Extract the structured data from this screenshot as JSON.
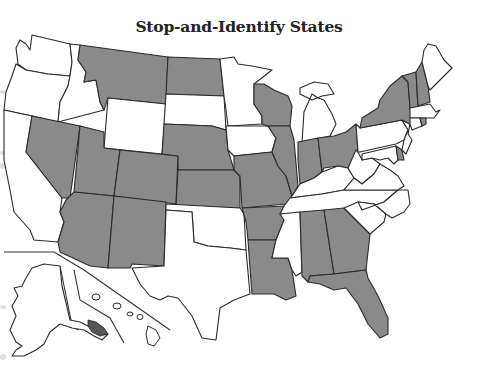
{
  "title": "Stop-and-Identify States",
  "colors": {
    "stop_and_identify": "#8a8a8a",
    "other": "#ffffff",
    "border": "#2a2a2a",
    "background": "#ffffff"
  },
  "legend": {
    "shaded_meaning": "Stop-and-Identify state",
    "unshaded_meaning": "Not a stop-and-identify state"
  },
  "map_data": {
    "type": "choropleth",
    "region": "United States",
    "categories": [
      "Stop-and-Identify",
      "Other"
    ],
    "shaded_states": [
      "Montana",
      "North Dakota",
      "Nebraska",
      "Kansas",
      "Nevada",
      "Utah",
      "Colorado",
      "Arizona",
      "New Mexico",
      "Missouri",
      "Arkansas",
      "Louisiana",
      "Wisconsin",
      "Illinois",
      "Indiana",
      "Ohio",
      "Alabama",
      "Georgia",
      "Florida",
      "New York",
      "Vermont",
      "New Hampshire",
      "Rhode Island",
      "Delaware"
    ],
    "unshaded_states": [
      "Washington",
      "Oregon",
      "California",
      "Idaho",
      "Wyoming",
      "South Dakota",
      "Oklahoma",
      "Texas",
      "Minnesota",
      "Iowa",
      "Michigan",
      "Kentucky",
      "Tennessee",
      "Mississippi",
      "West Virginia",
      "Virginia",
      "North Carolina",
      "South Carolina",
      "Pennsylvania",
      "New Jersey",
      "Maryland",
      "Connecticut",
      "Massachusetts",
      "Maine",
      "Alaska",
      "Hawaii"
    ]
  }
}
